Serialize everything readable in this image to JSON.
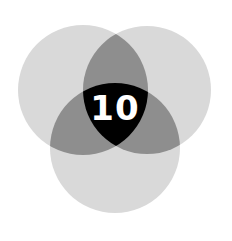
{
  "diagram": {
    "type": "venn-3",
    "center_label": "10",
    "circles": [
      {
        "id": "left",
        "cx": 83,
        "cy": 90,
        "r": 65
      },
      {
        "id": "right",
        "cx": 147,
        "cy": 90,
        "r": 64
      },
      {
        "id": "bottom",
        "cx": 115,
        "cy": 148,
        "r": 65
      }
    ],
    "colors": {
      "background": "#ffffff",
      "single": "#d9d9d9",
      "double": "#8e8e8e",
      "triple": "#000000",
      "label": "#ffffff"
    }
  }
}
